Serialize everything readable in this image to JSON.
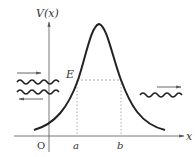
{
  "diagram": {
    "axes": {
      "y_label": "V(x)",
      "x_label": "x",
      "origin_label": "O"
    },
    "energy_label": "E",
    "turning_points": [
      "a",
      "b"
    ],
    "waves": {
      "incident_direction": "right",
      "reflected_direction": "left",
      "transmitted_direction": "right"
    },
    "colors": {
      "curve": "#222222",
      "axes": "#666666",
      "dashed": "#888888",
      "background": "#ffffff"
    }
  }
}
